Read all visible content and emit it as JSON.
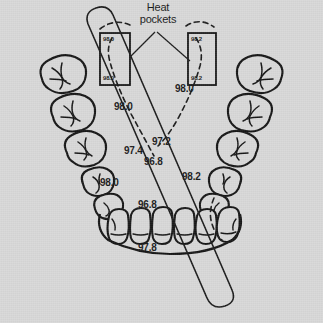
{
  "figure": {
    "name": "dental-arch-thermal-diagram",
    "background_color": "#d8d8d8",
    "ink_color": "#1a1a1a",
    "width": 323,
    "height": 323
  },
  "callout": {
    "line1": "Heat",
    "line2": "pockets"
  },
  "heat_pockets": [
    {
      "id": "left-heat-pocket",
      "top_value": "98.0",
      "bottom_value": "98.0",
      "x": 100,
      "y": 33,
      "w": 30,
      "h": 52
    },
    {
      "id": "right-heat-pocket",
      "top_value": "98.2",
      "bottom_value": "98.2",
      "x": 188,
      "y": 33,
      "w": 28,
      "h": 52
    }
  ],
  "temperature_labels": [
    {
      "id": "temp-left-upper",
      "value": "98.0",
      "x": 114,
      "y": 102
    },
    {
      "id": "temp-right-upper",
      "value": "98.0",
      "x": 175,
      "y": 84
    },
    {
      "id": "temp-center-972",
      "value": "97.2",
      "x": 152,
      "y": 137
    },
    {
      "id": "temp-left-974",
      "value": "97.4",
      "x": 124,
      "y": 146
    },
    {
      "id": "temp-center-968",
      "value": "96.8",
      "x": 144,
      "y": 157
    },
    {
      "id": "temp-right-982",
      "value": "98.2",
      "x": 182,
      "y": 172
    },
    {
      "id": "temp-left-980",
      "value": "98.0",
      "x": 100,
      "y": 178
    },
    {
      "id": "temp-incisal-968",
      "value": "96.8",
      "x": 138,
      "y": 200
    },
    {
      "id": "temp-bottom-978",
      "value": "97.8",
      "x": 138,
      "y": 243
    }
  ],
  "teeth": {
    "left_posterior_count": 5,
    "right_posterior_count": 5,
    "anterior_count": 6,
    "description": "mandibular dental arch occlusal view"
  },
  "instrument": {
    "id": "diagonal-probe-bar",
    "description": "elongated rounded bar crossing arch diagonally"
  }
}
